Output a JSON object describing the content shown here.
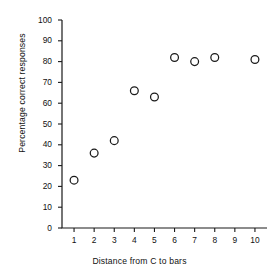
{
  "chart_data": {
    "type": "scatter",
    "title": "",
    "xlabel": "Distance from C to bars",
    "ylabel": "Percentage correct responses",
    "xlim": [
      0.4,
      10.6
    ],
    "ylim": [
      0,
      100
    ],
    "xticks": [
      1,
      2,
      3,
      4,
      5,
      6,
      7,
      8,
      9,
      10
    ],
    "xtick_labels": [
      "1",
      "2",
      "3",
      "4",
      "5",
      "6",
      "7",
      "8",
      "9",
      "10"
    ],
    "yticks": [
      0,
      10,
      20,
      30,
      40,
      50,
      60,
      70,
      80,
      90,
      100
    ],
    "ytick_labels": [
      "0",
      "10",
      "20",
      "30",
      "40",
      "50",
      "60",
      "70",
      "80",
      "90",
      "100"
    ],
    "grid": false,
    "legend": false,
    "marker": "open-circle",
    "marker_color": "#1a1a1a",
    "x": [
      1,
      2,
      3,
      4,
      5,
      6,
      7,
      8,
      10
    ],
    "values": [
      23,
      36,
      42,
      66,
      63,
      82,
      80,
      82,
      81
    ],
    "points": [
      {
        "x": 1,
        "y": 23
      },
      {
        "x": 2,
        "y": 36
      },
      {
        "x": 3,
        "y": 42
      },
      {
        "x": 4,
        "y": 66
      },
      {
        "x": 5,
        "y": 63
      },
      {
        "x": 6,
        "y": 82
      },
      {
        "x": 7,
        "y": 80
      },
      {
        "x": 8,
        "y": 82
      },
      {
        "x": 10,
        "y": 81
      }
    ]
  },
  "colors": {
    "background": "#ffffff",
    "axis": "#1a1a1a",
    "text": "#111111"
  }
}
